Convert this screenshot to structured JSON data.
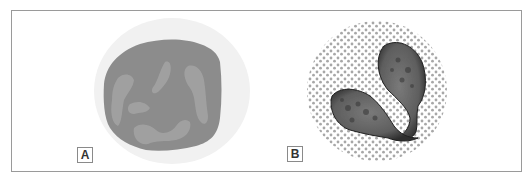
{
  "figure": {
    "panels": [
      {
        "label": "A",
        "subject": "cell with large round nucleus"
      },
      {
        "label": "B",
        "subject": "granulated cell with bilobed nucleus"
      }
    ]
  },
  "colors": {
    "frame": "#9a9a9a",
    "halo": "#f1f1f1",
    "nucleus_a": "#8c8c8c",
    "chromatin_a": "#a3a3a3",
    "nucleus_b": "#6a6a6a",
    "granule": "#a0a0a0"
  }
}
